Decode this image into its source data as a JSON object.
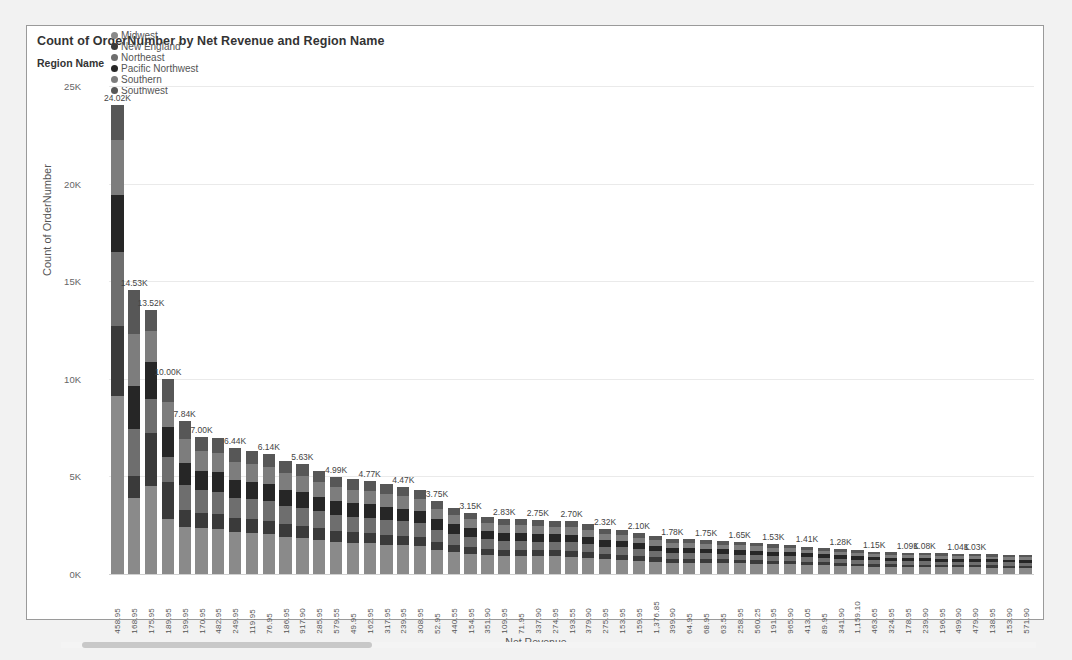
{
  "visual": {
    "title": "Count of OrderNumber by Net Revenue and Region Name",
    "x_axis_title": "Net Revenue",
    "y_axis_title": "Count of OrderNumber"
  },
  "legend": {
    "title": "Region Name",
    "items": [
      {
        "label": "Midwest",
        "color": "#8a8a8a"
      },
      {
        "label": "New England",
        "color": "#3a3a3a"
      },
      {
        "label": "Northeast",
        "color": "#6e6e6e"
      },
      {
        "label": "Pacific Northwest",
        "color": "#262626"
      },
      {
        "label": "Southern",
        "color": "#7d7d7d"
      },
      {
        "label": "Southwest",
        "color": "#575757"
      }
    ]
  },
  "scrollbar": {
    "orientation": "horizontal",
    "thumb_start_pct": 2,
    "thumb_width_pct": 30
  },
  "chart_data": {
    "type": "bar",
    "subtype": "stacked-column",
    "title": "Count of OrderNumber by Net Revenue and Region Name",
    "xlabel": "Net Revenue",
    "ylabel": "Count of OrderNumber",
    "ylim": [
      0,
      25000
    ],
    "ytick_labels": [
      "0K",
      "5K",
      "10K",
      "15K",
      "20K",
      "25K"
    ],
    "ytick_values": [
      0,
      5000,
      10000,
      15000,
      20000,
      25000
    ],
    "grid": true,
    "legend_position": "top",
    "series_names": [
      "Midwest",
      "New England",
      "Northeast",
      "Pacific Northwest",
      "Southern",
      "Southwest"
    ],
    "categories": [
      "458.95",
      "168.95",
      "175.95",
      "189.95",
      "199.95",
      "170.95",
      "482.95",
      "249.95",
      "119.95",
      "76.95",
      "186.95",
      "917.90",
      "285.95",
      "579.55",
      "49.95",
      "162.95",
      "317.95",
      "239.95",
      "308.95",
      "52.95",
      "440.55",
      "154.95",
      "351.90",
      "109.95",
      "71.95",
      "337.90",
      "274.95",
      "193.55",
      "379.90",
      "275.95",
      "153.95",
      "159.95",
      "1,376.85",
      "399.90",
      "64.95",
      "68.95",
      "63.55",
      "258.95",
      "560.25",
      "191.95",
      "965.90",
      "413.05",
      "89.95",
      "341.90",
      "1,159.10",
      "463.65",
      "324.95",
      "178.95",
      "239.90",
      "196.95",
      "499.90",
      "479.90",
      "138.95",
      "153.90",
      "571.90"
    ],
    "totals": [
      24020,
      14530,
      13520,
      10000,
      7840,
      7000,
      6950,
      6440,
      6300,
      6140,
      5800,
      5630,
      5300,
      4990,
      4860,
      4770,
      4600,
      4470,
      4300,
      3750,
      3400,
      3150,
      2950,
      2830,
      2800,
      2750,
      2740,
      2700,
      2560,
      2320,
      2250,
      2100,
      1950,
      1780,
      1770,
      1750,
      1700,
      1650,
      1600,
      1530,
      1490,
      1410,
      1350,
      1280,
      1220,
      1150,
      1120,
      1090,
      1080,
      1060,
      1040,
      1030,
      1010,
      990,
      960
    ],
    "data_labels": [
      "24.02K",
      "14.53K",
      "13.52K",
      "10.00K",
      "7.84K",
      "7.00K",
      "",
      "6.44K",
      "",
      "6.14K",
      "",
      "5.63K",
      "",
      "4.99K",
      "",
      "4.77K",
      "",
      "4.47K",
      "",
      "3.75K",
      "",
      "3.15K",
      "",
      "2.83K",
      "",
      "2.75K",
      "",
      "2.70K",
      "",
      "2.32K",
      "",
      "2.10K",
      "",
      "1.78K",
      "",
      "1.75K",
      "",
      "1.65K",
      "",
      "1.53K",
      "",
      "1.41K",
      "",
      "1.28K",
      "",
      "1.15K",
      "",
      "1.09K",
      "1.08K",
      "",
      "1.04K",
      "1.03K",
      "",
      "",
      ""
    ],
    "series": [
      {
        "name": "Midwest",
        "values": [
          9100,
          3900,
          4500,
          2800,
          2400,
          2350,
          2300,
          2150,
          2100,
          2050,
          1900,
          1850,
          1750,
          1650,
          1600,
          1580,
          1500,
          1470,
          1420,
          1240,
          1120,
          1040,
          970,
          930,
          920,
          900,
          900,
          890,
          840,
          760,
          740,
          690,
          640,
          585,
          580,
          575,
          560,
          540,
          525,
          500,
          490,
          465,
          445,
          420,
          400,
          378,
          368,
          358,
          355,
          348,
          342,
          338,
          332,
          325,
          315
        ]
      },
      {
        "name": "New England",
        "values": [
          3600,
          1100,
          2700,
          1900,
          900,
          800,
          780,
          720,
          700,
          690,
          650,
          630,
          590,
          560,
          545,
          535,
          515,
          500,
          480,
          420,
          380,
          352,
          330,
          317,
          313,
          308,
          306,
          302,
          286,
          260,
          252,
          235,
          218,
          199,
          198,
          196,
          190,
          184,
          179,
          171,
          167,
          158,
          151,
          143,
          137,
          129,
          125,
          122,
          121,
          119,
          116,
          115,
          113,
          111,
          107
        ]
      },
      {
        "name": "Northeast",
        "values": [
          3800,
          2450,
          1750,
          1300,
          1250,
          1150,
          1140,
          1050,
          1030,
          1000,
          950,
          920,
          865,
          815,
          795,
          780,
          750,
          730,
          703,
          613,
          556,
          515,
          482,
          463,
          458,
          450,
          448,
          441,
          418,
          379,
          368,
          343,
          319,
          291,
          289,
          286,
          278,
          270,
          261,
          250,
          244,
          230,
          221,
          209,
          199,
          188,
          183,
          178,
          176,
          173,
          170,
          168,
          165,
          162,
          157
        ]
      },
      {
        "name": "Pacific Northwest",
        "values": [
          2900,
          2200,
          1900,
          1550,
          1120,
          1000,
          995,
          920,
          900,
          878,
          829,
          805,
          758,
          713,
          695,
          682,
          658,
          639,
          615,
          536,
          486,
          450,
          422,
          405,
          400,
          393,
          392,
          386,
          366,
          332,
          322,
          300,
          279,
          255,
          253,
          250,
          243,
          236,
          229,
          219,
          213,
          202,
          193,
          183,
          174,
          164,
          160,
          156,
          154,
          152,
          149,
          147,
          144,
          142,
          137
        ]
      },
      {
        "name": "Southern",
        "values": [
          2820,
          2630,
          1610,
          1250,
          1230,
          1000,
          993,
          915,
          895,
          873,
          824,
          800,
          753,
          709,
          691,
          678,
          654,
          635,
          611,
          533,
          483,
          448,
          419,
          402,
          398,
          391,
          389,
          384,
          364,
          330,
          320,
          298,
          277,
          253,
          252,
          249,
          242,
          235,
          228,
          218,
          212,
          201,
          192,
          182,
          174,
          164,
          159,
          155,
          154,
          151,
          148,
          147,
          144,
          141,
          137
        ]
      },
      {
        "name": "Southwest",
        "values": [
          1800,
          2250,
          1060,
          1200,
          940,
          700,
          742,
          685,
          675,
          649,
          647,
          625,
          584,
          543,
          534,
          515,
          523,
          505,
          491,
          408,
          375,
          345,
          322,
          313,
          311,
          308,
          305,
          297,
          282,
          259,
          248,
          234,
          217,
          197,
          198,
          194,
          187,
          185,
          178,
          172,
          164,
          154,
          148,
          143,
          136,
          127,
          125,
          121,
          120,
          117,
          115,
          115,
          112,
          109,
          107
        ]
      }
    ]
  }
}
